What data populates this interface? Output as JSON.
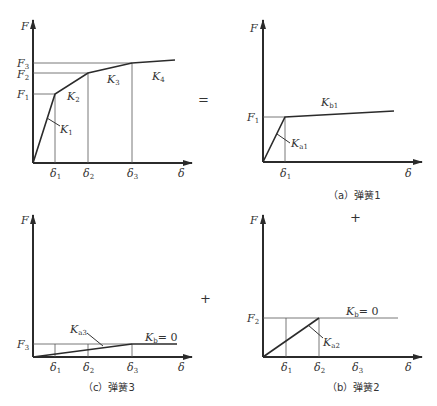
{
  "operators": {
    "equals": "=",
    "plus_right": "+",
    "plus_bottom": "+"
  },
  "axis_labels": {
    "y": "F",
    "x": "δ"
  },
  "panels": {
    "total": {
      "y_ticks": [
        {
          "base": "F",
          "sub": "3"
        },
        {
          "base": "F",
          "sub": "2"
        },
        {
          "base": "F",
          "sub": "1"
        }
      ],
      "x_ticks": [
        {
          "base": "δ",
          "sub": "1"
        },
        {
          "base": "δ",
          "sub": "2"
        },
        {
          "base": "δ",
          "sub": "3"
        }
      ],
      "stiffness_labels": [
        {
          "base": "K",
          "sub": "1"
        },
        {
          "base": "K",
          "sub": "2"
        },
        {
          "base": "K",
          "sub": "3"
        },
        {
          "base": "K",
          "sub": "4"
        }
      ]
    },
    "a": {
      "caption": "（a）弹簧1",
      "y_tick": {
        "base": "F",
        "sub": "1"
      },
      "x_tick": {
        "base": "δ",
        "sub": "1"
      },
      "ka": {
        "base": "K",
        "sub": "a1"
      },
      "kb": {
        "base": "K",
        "sub": "b1"
      }
    },
    "b": {
      "caption": "（b）弹簧2",
      "y_tick": {
        "base": "F",
        "sub": "2"
      },
      "x_ticks": [
        {
          "base": "δ",
          "sub": "1"
        },
        {
          "base": "δ",
          "sub": "2"
        },
        {
          "base": "δ",
          "sub": "3"
        }
      ],
      "ka": {
        "base": "K",
        "sub": "a2"
      },
      "kb": {
        "base": "K",
        "sub": "b",
        "suffix": "= 0"
      }
    },
    "c": {
      "caption": "（c）弹簧3",
      "y_tick": {
        "base": "F",
        "sub": "3"
      },
      "x_ticks": [
        {
          "base": "δ",
          "sub": "1"
        },
        {
          "base": "δ",
          "sub": "2"
        },
        {
          "base": "δ",
          "sub": "3"
        }
      ],
      "ka": {
        "base": "K",
        "sub": "a3"
      },
      "kb": {
        "base": "K",
        "sub": "b",
        "suffix": "= 0"
      }
    }
  }
}
